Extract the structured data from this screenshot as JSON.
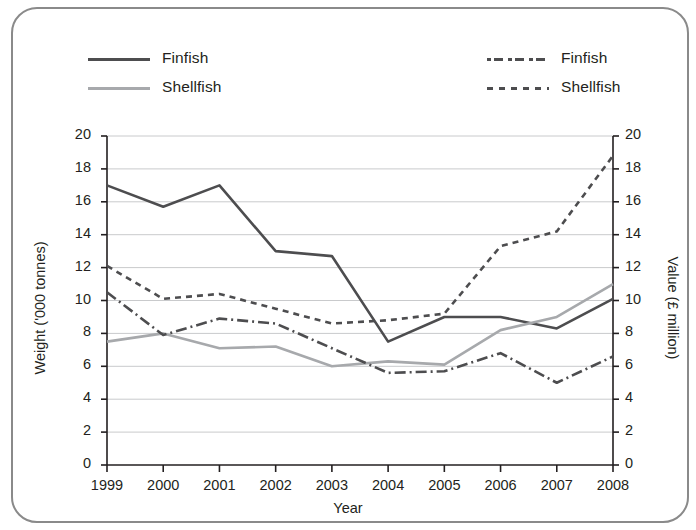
{
  "legend": {
    "left": [
      {
        "label": "Finfish",
        "style": "solid-dark",
        "icon": "solid-line-icon"
      },
      {
        "label": "Shellfish",
        "style": "solid-gray",
        "icon": "solid-line-icon"
      }
    ],
    "right": [
      {
        "label": "Finfish",
        "style": "dashdot",
        "icon": "dash-dot-line-icon"
      },
      {
        "label": "Shellfish",
        "style": "dotted",
        "icon": "dotted-line-icon"
      }
    ]
  },
  "colors": {
    "finfish_weight": "#4d4d4f",
    "shellfish_weight": "#a7a9ac",
    "finfish_value": "#4d4d4f",
    "shellfish_value": "#4d4d4f",
    "grid": "#c9cacc",
    "axis": "#231f20",
    "frame": "#8a8a8a"
  },
  "chart_data": {
    "type": "line",
    "title": "",
    "xlabel": "Year",
    "ylabel": "Weight ('000 tonnes)",
    "y2label": "Value (£ million)",
    "categories": [
      "1999",
      "2000",
      "2001",
      "2002",
      "2003",
      "2004",
      "2005",
      "2006",
      "2007",
      "2008"
    ],
    "x": [
      1999,
      2000,
      2001,
      2002,
      2003,
      2004,
      2005,
      2006,
      2007,
      2008
    ],
    "ylim": [
      0,
      20
    ],
    "y2lim": [
      0,
      20
    ],
    "yticks": [
      0,
      2,
      4,
      6,
      8,
      10,
      12,
      14,
      16,
      18,
      20
    ],
    "y2ticks": [
      0,
      2,
      4,
      6,
      8,
      10,
      12,
      14,
      16,
      18,
      20
    ],
    "grid": true,
    "legend_position": "top",
    "series": [
      {
        "name": "Finfish",
        "axis": "left",
        "unit": "'000 tonnes",
        "line_style": "solid",
        "color": "#4d4d4f",
        "values": [
          17.0,
          15.7,
          17.0,
          13.0,
          12.7,
          7.5,
          9.0,
          9.0,
          8.3,
          10.1
        ]
      },
      {
        "name": "Shellfish",
        "axis": "left",
        "unit": "'000 tonnes",
        "line_style": "solid",
        "color": "#a7a9ac",
        "values": [
          7.5,
          8.0,
          7.1,
          7.2,
          6.0,
          6.3,
          6.1,
          8.2,
          9.0,
          11.0
        ]
      },
      {
        "name": "Finfish",
        "axis": "right",
        "unit": "£ million",
        "line_style": "dash-dot",
        "color": "#4d4d4f",
        "values": [
          10.5,
          7.9,
          8.9,
          8.6,
          7.1,
          5.6,
          5.7,
          6.8,
          5.0,
          6.6
        ]
      },
      {
        "name": "Shellfish",
        "axis": "right",
        "unit": "£ million",
        "line_style": "dotted",
        "color": "#4d4d4f",
        "values": [
          12.1,
          10.1,
          10.4,
          9.5,
          8.6,
          8.8,
          9.2,
          13.3,
          14.2,
          18.8
        ]
      }
    ]
  }
}
